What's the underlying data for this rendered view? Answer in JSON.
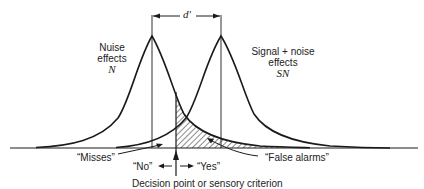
{
  "diagram": {
    "separation_label": "d'",
    "noise_curve": {
      "label_lines": [
        "Nuise",
        "effects"
      ],
      "symbol": "N"
    },
    "signal_curve": {
      "label_lines": [
        "Signal + noise",
        "effects"
      ],
      "symbol": "SN"
    },
    "regions": {
      "misses": "“Misses”",
      "false_alarms": "“False alarms”"
    },
    "responses": {
      "no": "“No”",
      "yes": "“Yes”"
    },
    "criterion_label": "Decision point or sensory criterion",
    "colors": {
      "line": "#1a1a1a",
      "background": "#ffffff"
    }
  }
}
